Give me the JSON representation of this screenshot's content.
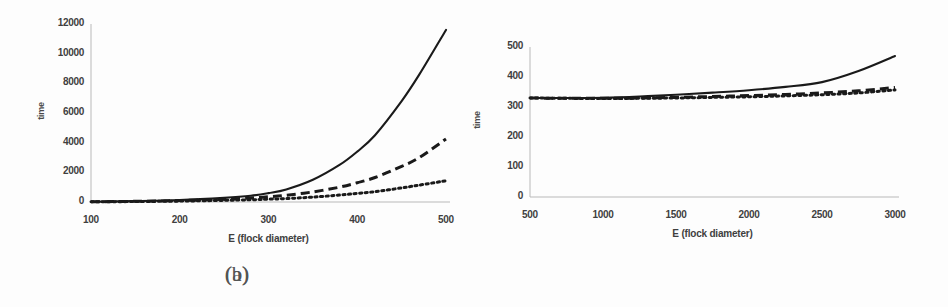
{
  "figure": {
    "panels": [
      {
        "caption": "(a)",
        "ylabel": "time",
        "xlabel": "E  (flock  diameter)",
        "yticks": [
          "0",
          "2000",
          "4000",
          "6000",
          "8000",
          "10000",
          "12000"
        ],
        "xticks": [
          "100",
          "200",
          "300",
          "400",
          "500"
        ]
      },
      {
        "caption": "(b)",
        "ylabel": "time",
        "xlabel": "E (flock diameter)",
        "yticks": [
          "0",
          "100",
          "200",
          "300",
          "400",
          "500"
        ],
        "xticks": [
          "500",
          "1000",
          "1500",
          "2000",
          "2500",
          "3000"
        ]
      }
    ]
  },
  "colors": {
    "line": "#1a1a1a",
    "axis": "#b9b9b9",
    "tick_text": "#3f3f3f",
    "background": "#fdfdfd"
  },
  "chart_data": [
    {
      "type": "line",
      "title": "(a)",
      "xlabel": "E  (flock  diameter)",
      "ylabel": "time",
      "xlim": [
        100,
        500
      ],
      "ylim": [
        0,
        12000
      ],
      "xticks": [
        100,
        200,
        300,
        400,
        500
      ],
      "yticks": [
        0,
        2000,
        4000,
        6000,
        8000,
        10000,
        12000
      ],
      "grid": false,
      "legend": "none",
      "x": [
        100,
        150,
        200,
        250,
        280,
        300,
        320,
        350,
        380,
        400,
        420,
        450,
        470,
        500
      ],
      "series": [
        {
          "name": "solid",
          "style": "solid",
          "values": [
            20,
            60,
            130,
            280,
            420,
            600,
            850,
            1500,
            2500,
            3400,
            4500,
            6800,
            8600,
            11600
          ]
        },
        {
          "name": "dashed",
          "style": "dashed",
          "values": [
            15,
            45,
            95,
            190,
            270,
            350,
            450,
            680,
            1000,
            1300,
            1650,
            2400,
            3000,
            4250
          ]
        },
        {
          "name": "dotted",
          "style": "dotted",
          "values": [
            10,
            30,
            60,
            110,
            150,
            190,
            230,
            330,
            470,
            580,
            700,
            950,
            1140,
            1430
          ]
        }
      ]
    },
    {
      "type": "line",
      "title": "(b)",
      "xlabel": "E (flock diameter)",
      "ylabel": "time",
      "xlim": [
        500,
        3000
      ],
      "ylim": [
        0,
        500
      ],
      "xticks": [
        500,
        1000,
        1500,
        2000,
        2500,
        3000
      ],
      "yticks": [
        0,
        100,
        200,
        300,
        400,
        500
      ],
      "grid": false,
      "legend": "none",
      "x": [
        500,
        750,
        1000,
        1250,
        1500,
        1750,
        2000,
        2250,
        2500,
        2750,
        3000
      ],
      "series": [
        {
          "name": "solid",
          "style": "solid",
          "values": [
            330,
            330,
            331,
            335,
            341,
            348,
            356,
            367,
            383,
            420,
            470
          ]
        },
        {
          "name": "dashed",
          "style": "dashed",
          "values": [
            330,
            329,
            329,
            330,
            332,
            335,
            338,
            342,
            347,
            354,
            365
          ]
        },
        {
          "name": "dotted",
          "style": "dotted",
          "values": [
            330,
            329,
            328,
            329,
            330,
            332,
            334,
            337,
            341,
            347,
            357
          ]
        }
      ]
    }
  ]
}
